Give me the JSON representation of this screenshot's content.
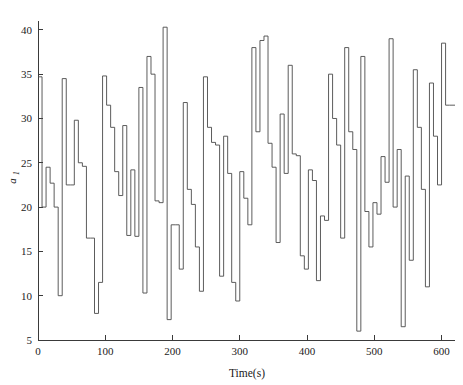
{
  "chart_data": {
    "type": "line",
    "title": "",
    "subtitle": "",
    "xlabel": "Time(s)",
    "ylabel": "a1",
    "ylabel_base": "a",
    "ylabel_sub": "1",
    "xlim": [
      0,
      620
    ],
    "ylim": [
      5,
      41
    ],
    "xticks": [
      0,
      100,
      200,
      300,
      400,
      500,
      600
    ],
    "xticklabels": [
      "0",
      "100",
      "200",
      "300",
      "400",
      "500",
      "600"
    ],
    "yticks": [
      5,
      10,
      15,
      20,
      25,
      30,
      35,
      40
    ],
    "yticklabels": [
      "5",
      "10",
      "15",
      "20",
      "25",
      "30",
      "35",
      "40"
    ],
    "grid": false,
    "legend": null,
    "drawstyle": "steps-post",
    "line_color": "#4a4a4a",
    "line_width": 0.9,
    "spines": [
      "left",
      "bottom"
    ],
    "series": [
      {
        "name": "a1",
        "x": [
          0,
          6,
          12,
          18,
          24,
          30,
          36,
          42,
          48,
          54,
          60,
          66,
          72,
          78,
          84,
          90,
          96,
          102,
          108,
          114,
          120,
          126,
          132,
          138,
          144,
          150,
          156,
          162,
          168,
          174,
          180,
          186,
          192,
          198,
          204,
          210,
          216,
          222,
          228,
          234,
          240,
          246,
          252,
          258,
          264,
          270,
          276,
          282,
          288,
          294,
          300,
          306,
          312,
          318,
          324,
          330,
          336,
          342,
          348,
          354,
          360,
          366,
          372,
          378,
          384,
          390,
          396,
          402,
          408,
          414,
          420,
          426,
          432,
          438,
          444,
          450,
          456,
          462,
          468,
          474,
          480,
          486,
          492,
          498,
          504,
          510,
          516,
          522,
          528,
          534,
          540,
          546,
          552,
          558,
          564,
          570,
          576,
          582,
          588,
          594,
          600,
          606,
          612
        ],
        "values": [
          34.7,
          20.0,
          24.5,
          22.7,
          20.0,
          10.0,
          34.5,
          22.5,
          22.5,
          29.8,
          25.0,
          24.6,
          16.5,
          16.5,
          8.0,
          11.5,
          34.8,
          31.5,
          29.0,
          24.0,
          21.3,
          29.2,
          16.8,
          24.2,
          16.7,
          33.5,
          10.3,
          37.0,
          35.0,
          20.7,
          20.5,
          40.3,
          7.3,
          18.0,
          18.0,
          13.0,
          31.8,
          22.0,
          20.3,
          15.5,
          10.5,
          34.7,
          29.0,
          27.3,
          27.0,
          12.2,
          28.0,
          23.8,
          11.5,
          9.4,
          24.0,
          21.0,
          18.0,
          38.0,
          28.5,
          38.8,
          39.3,
          27.2,
          24.5,
          16.0,
          30.5,
          23.8,
          36.0,
          26.0,
          25.8,
          14.5,
          13.0,
          24.2,
          23.0,
          11.7,
          19.0,
          18.5,
          35.0,
          30.0,
          27.0,
          16.5,
          38.0,
          28.5,
          26.5,
          6.0,
          37.0,
          19.5,
          15.5,
          20.5,
          19.2,
          25.7,
          22.8,
          39.0,
          20.0,
          26.5,
          6.5,
          23.5,
          14.0,
          35.5,
          29.0,
          22.0,
          11.0,
          34.0,
          28.0,
          22.5,
          38.5,
          31.5,
          31.5
        ]
      }
    ]
  }
}
